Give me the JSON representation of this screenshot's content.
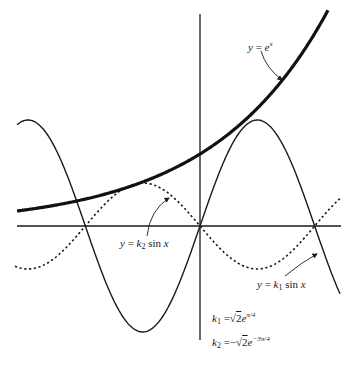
{
  "figure": {
    "colors": {
      "ink": "#1a1a1a",
      "background": "#ffffff"
    },
    "axes": {
      "x_axis_y": 226,
      "x_from": 17,
      "x_to": 341,
      "y_axis_x": 200,
      "y_from": 14,
      "y_to": 340
    },
    "labels": {
      "exp": {
        "y": "y",
        "eq": " = ",
        "e": "e",
        "exp": "x"
      },
      "k2sin": {
        "y": "y",
        "eq": " = ",
        "k": "k",
        "sub": "2",
        "sin": " sin ",
        "x": "x"
      },
      "k1sin": {
        "y": "y",
        "eq": " = ",
        "k": "k",
        "sub": "1",
        "sin": " sin ",
        "x": "x"
      },
      "k1def": {
        "k": "k",
        "sub": "1",
        "eq": " =",
        "root": "√",
        "rad": "2",
        "e": "e",
        "exp": "π/4"
      },
      "k2def": {
        "k": "k",
        "sub": "2",
        "eq": " =−",
        "root": "√",
        "rad": "2",
        "e": "e",
        "exp": "−3π/4"
      }
    }
  },
  "chart_data": {
    "type": "line",
    "title": "",
    "xlabel": "",
    "ylabel": "",
    "grid": false,
    "legend": "inline annotations with arrows",
    "x_range": [
      -5.0,
      3.8
    ],
    "series": [
      {
        "name": "y = e^x",
        "style": "thick solid",
        "x": [
          -5.0,
          -3.14,
          -1.57,
          0,
          1.57,
          3.14,
          3.5
        ],
        "values_px": [
          211,
          198,
          185,
          154,
          107,
          37,
          17
        ]
      },
      {
        "name": "y = k1 sin x",
        "style": "thin solid",
        "k": "k1 = √2 e^(π/4)",
        "zeros": [
          -3.14,
          0,
          3.14
        ],
        "max_at": 1.57,
        "min_at": -1.57
      },
      {
        "name": "y = k2 sin x",
        "style": "dotted",
        "k": "k2 = −√2 e^(−3π/4)",
        "zeros": [
          -3.14,
          0,
          3.14
        ],
        "max_at": -1.57,
        "min_at": 1.57
      }
    ],
    "annotations": [
      "y = e^x",
      "y = k2 sin x",
      "y = k1 sin x",
      "k1 = √2 e^(π/4)",
      "k2 = −√2 e^(−3π/4)"
    ]
  }
}
